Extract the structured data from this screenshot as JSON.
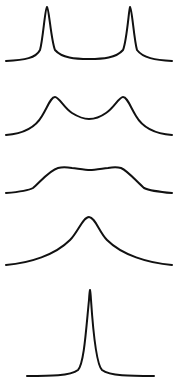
{
  "diagram": {
    "line_color": "#111111",
    "background": "#ffffff",
    "traces": [
      {
        "id": "trace-1",
        "label": "two sharp separated peaks",
        "path": "M6,61 C25,60 36,58 40,50 C43,40 45,8 47,7 C49,8 51,40 55,50 C62,58 75,59 89,59 C103,59 116,58 123,50 C127,40 129,8 130,7 C132,8 134,40 137,50 C143,58 155,60 172,61"
      },
      {
        "id": "trace-2",
        "label": "two broadened peaks",
        "path": "M6,135 C20,134 34,130 42,116 C48,106 51,97 55,97 C59,97 64,108 72,113 C80,118 86,119 89,119 C93,119 99,118 106,113 C114,108 119,97 123,97 C127,97 130,106 136,116 C144,130 158,134 172,135"
      },
      {
        "id": "trace-3",
        "label": "flat-topped merged band",
        "path": "M6,193 C18,192 28,191 33,188 C40,182 50,170 58,168 C62,167 66,167 72,168 C80,169 86,170 90,170 C94,170 100,169 108,168 C114,167 117,167 121,168 C128,171 137,182 144,188 C150,191 160,192 172,193"
      },
      {
        "id": "trace-4",
        "label": "single broad peak",
        "path": "M6,265 C30,263 55,255 70,240 C78,232 83,217 89,217 C95,217 99,232 107,240 C122,255 148,263 172,265"
      },
      {
        "id": "trace-5",
        "label": "single sharp peak",
        "path": "M27,376 C50,376 70,376 78,370 C84,364 86,330 89,300 C89.5,292 90,290 90,290 C90,290 90.5,292 91,300 C93,330 96,364 102,370 C110,376 130,376 154,376"
      }
    ]
  }
}
